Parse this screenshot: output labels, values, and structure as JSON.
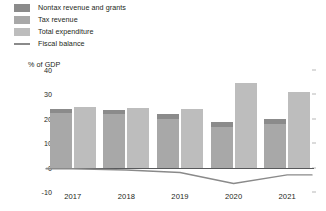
{
  "chart_data": {
    "type": "bar",
    "title": "",
    "subtitle": "",
    "xlabel": "",
    "ylabel": "% of GDP",
    "categories": [
      "2017",
      "2018",
      "2019",
      "2020",
      "2021"
    ],
    "ylim": [
      -10,
      40
    ],
    "yticks": [
      40,
      30,
      20,
      10,
      0,
      -10
    ],
    "ytick_labels": [
      "40",
      "30",
      "20",
      "10",
      "0",
      "-10"
    ],
    "grid": false,
    "legend_position": "top-left",
    "series": [
      {
        "name": "Nontax revenue and grants",
        "type": "bar-stacked-top",
        "color": "#8b8b8b",
        "values": [
          1.5,
          1.5,
          2.0,
          2.0,
          2.0
        ]
      },
      {
        "name": "Tax revenue",
        "type": "bar-stacked-bottom",
        "color": "#a8a8a8",
        "values": [
          22.5,
          22.0,
          20.0,
          16.5,
          18.0
        ]
      },
      {
        "name": "Total expenditure",
        "type": "bar",
        "color": "#bdbdbd",
        "values": [
          25.0,
          24.5,
          24.0,
          34.5,
          31.0
        ]
      },
      {
        "name": "Fiscal balance",
        "type": "line",
        "color": "#8a8a8a",
        "values": [
          -0.5,
          -1.0,
          -2.0,
          -6.5,
          -3.0
        ]
      }
    ]
  },
  "legend": {
    "items": [
      {
        "label": "Nontax revenue and grants",
        "swatch": "#8b8b8b",
        "marker": "square"
      },
      {
        "label": "Tax revenue",
        "swatch": "#a8a8a8",
        "marker": "square"
      },
      {
        "label": "Total expenditure",
        "swatch": "#bdbdbd",
        "marker": "square"
      },
      {
        "label": "Fiscal balance",
        "swatch": "#8a8a8a",
        "marker": "line"
      }
    ]
  },
  "axes": {
    "y_title": "% of GDP"
  }
}
